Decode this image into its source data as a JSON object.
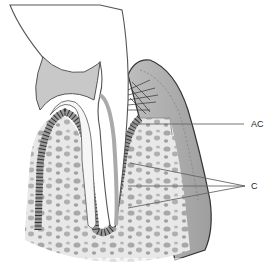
{
  "diagram": {
    "labels": [
      {
        "id": "AC",
        "text": "AC",
        "x": 251,
        "y": 119
      },
      {
        "id": "C",
        "text": "C",
        "x": 251,
        "y": 181
      }
    ],
    "colors": {
      "background": "#ffffff",
      "tooth_outline": "#555555",
      "pulp_gray": "#c8c8c8",
      "dentin_light": "#f2f2f2",
      "bone_fill": "#e4e4e4",
      "bone_trabecula": "#a8a8a8",
      "gingiva": "#b4b4b4",
      "ligament_dark": "#333333"
    }
  }
}
